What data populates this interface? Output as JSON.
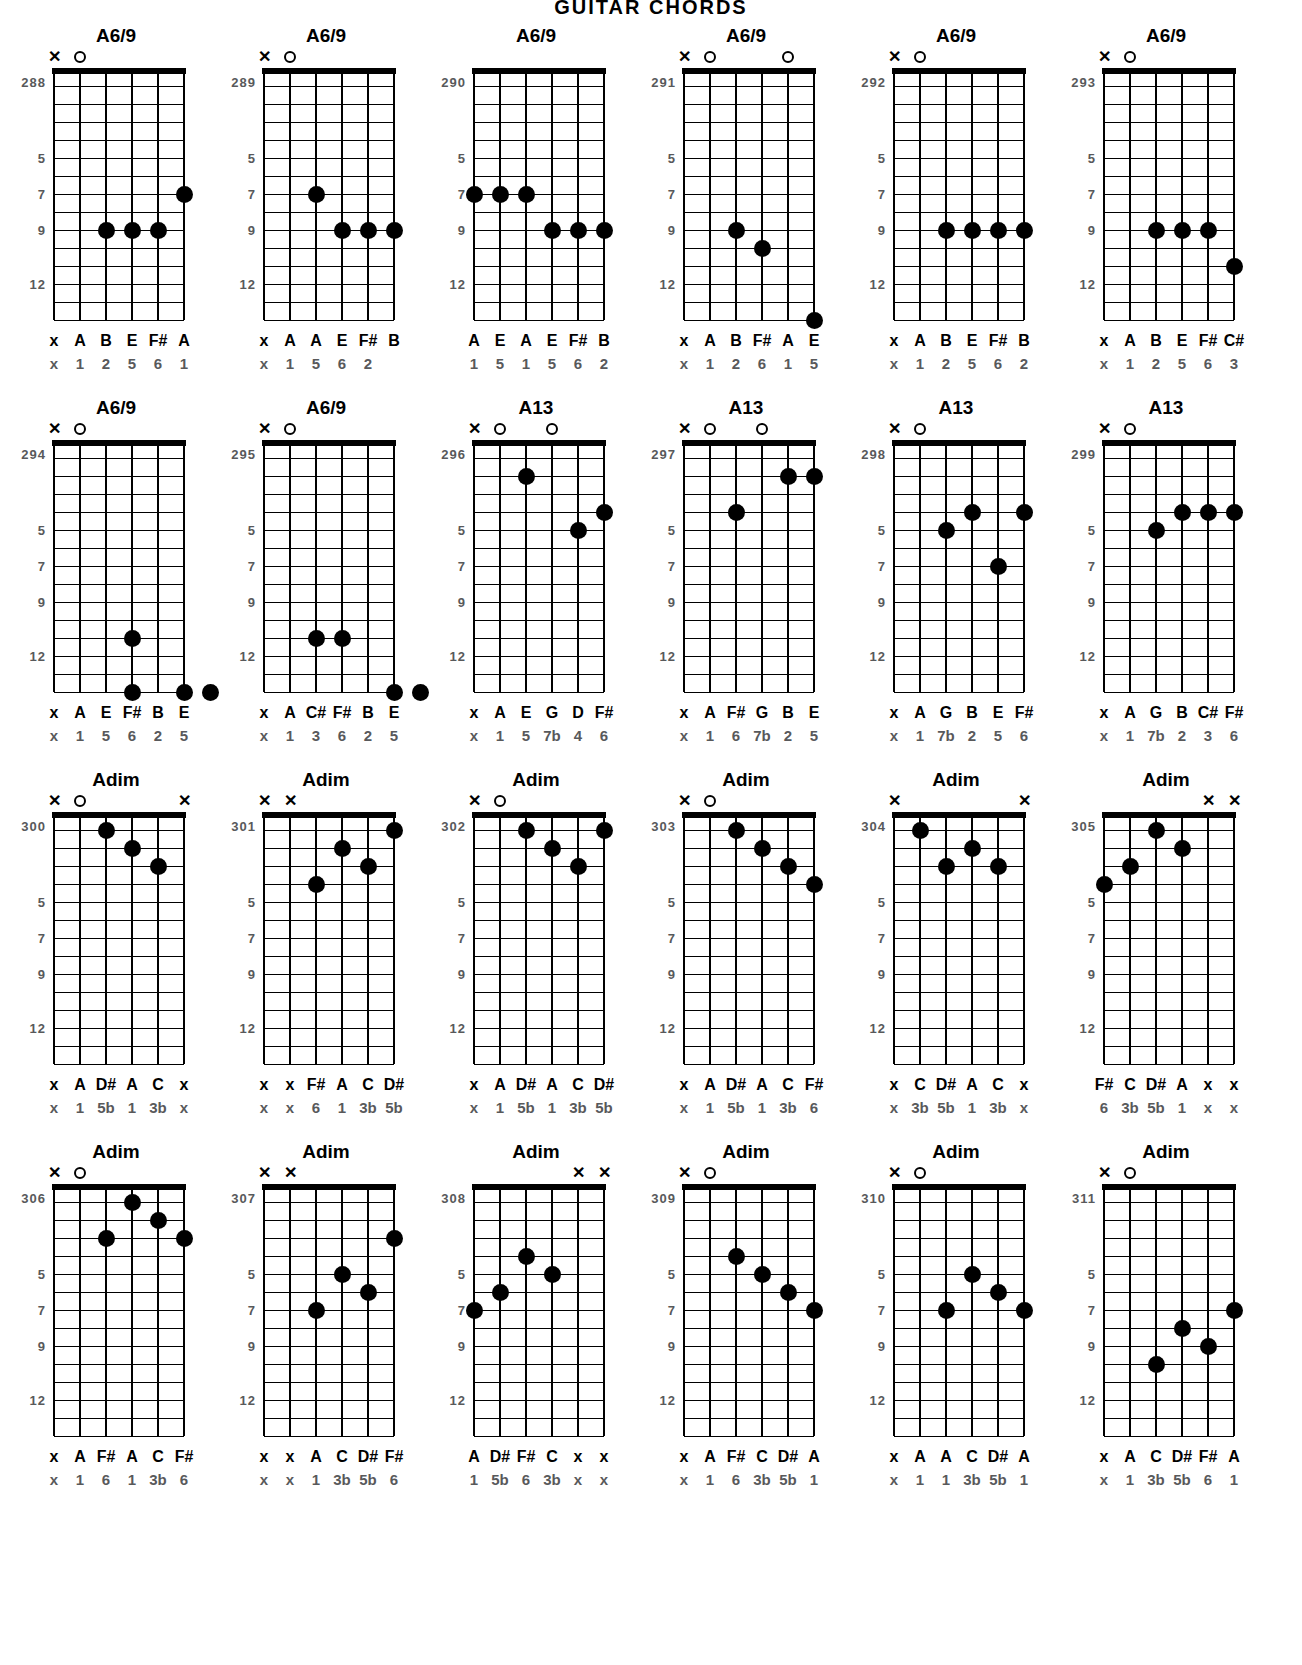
{
  "page": {
    "header": "GUITAR CHORDS",
    "fret_labels": [
      "5",
      "7",
      "9",
      "12"
    ],
    "fret_label_positions": [
      5,
      7,
      9,
      12
    ],
    "total_frets": 14,
    "strings": 6,
    "dot_color": "#000000",
    "number_color": "#58595b"
  },
  "charts": [
    {
      "number": "288",
      "name": "A6/9",
      "markers": [
        "x",
        "o",
        "",
        "",
        "",
        ""
      ],
      "dots": [
        null,
        null,
        9,
        9,
        9,
        7
      ],
      "notes": [
        "x",
        "A",
        "B",
        "E",
        "F#",
        "A"
      ],
      "degrees": [
        "x",
        "1",
        "2",
        "5",
        "6",
        "1"
      ]
    },
    {
      "number": "289",
      "name": "A6/9",
      "markers": [
        "x",
        "o",
        "",
        "",
        "",
        ""
      ],
      "dots": [
        null,
        null,
        7,
        9,
        9,
        9
      ],
      "notes": [
        "x",
        "A",
        "A",
        "E",
        "F#",
        "B"
      ],
      "degrees": [
        "x",
        "1",
        "5",
        "6",
        "2"
      ]
    },
    {
      "number": "290",
      "name": "A6/9",
      "markers": [
        "",
        "",
        "",
        "",
        "",
        ""
      ],
      "dots": [
        7,
        7,
        7,
        9,
        9,
        9
      ],
      "notes": [
        "A",
        "E",
        "A",
        "E",
        "F#",
        "B"
      ],
      "degrees": [
        "1",
        "5",
        "1",
        "5",
        "6",
        "2"
      ]
    },
    {
      "number": "291",
      "name": "A6/9",
      "markers": [
        "x",
        "o",
        "",
        "",
        "o",
        ""
      ],
      "dots": [
        null,
        null,
        9,
        10,
        null,
        14
      ],
      "notes": [
        "x",
        "A",
        "B",
        "F#",
        "A",
        "E"
      ],
      "degrees": [
        "x",
        "1",
        "2",
        "6",
        "1",
        "5"
      ]
    },
    {
      "number": "292",
      "name": "A6/9",
      "markers": [
        "x",
        "o",
        "",
        "",
        "",
        ""
      ],
      "dots": [
        null,
        null,
        9,
        9,
        9,
        9
      ],
      "notes": [
        "x",
        "A",
        "B",
        "E",
        "F#",
        "B"
      ],
      "degrees": [
        "x",
        "1",
        "2",
        "5",
        "6",
        "2"
      ]
    },
    {
      "number": "293",
      "name": "A6/9",
      "markers": [
        "x",
        "o",
        "",
        "",
        "",
        ""
      ],
      "dots": [
        null,
        null,
        9,
        9,
        9,
        11
      ],
      "notes": [
        "x",
        "A",
        "B",
        "E",
        "F#",
        "C#"
      ],
      "degrees": [
        "x",
        "1",
        "2",
        "5",
        "6",
        "3"
      ]
    },
    {
      "number": "294",
      "name": "A6/9",
      "markers": [
        "x",
        "o",
        "",
        "",
        "",
        ""
      ],
      "dots": [
        null,
        null,
        null,
        11,
        null,
        null
      ],
      "extra_dots": [
        {
          "string": 3,
          "fret": 14
        },
        {
          "string": 5,
          "fret": 14
        },
        {
          "string": 6,
          "fret": 14
        }
      ],
      "notes": [
        "x",
        "A",
        "E",
        "F#",
        "B",
        "E"
      ],
      "degrees": [
        "x",
        "1",
        "5",
        "6",
        "2",
        "5"
      ]
    },
    {
      "number": "295",
      "name": "A6/9",
      "markers": [
        "x",
        "o",
        "",
        "",
        "",
        ""
      ],
      "dots": [
        null,
        null,
        11,
        11,
        null,
        null
      ],
      "extra_dots": [
        {
          "string": 5,
          "fret": 14
        },
        {
          "string": 6,
          "fret": 14
        }
      ],
      "notes": [
        "x",
        "A",
        "C#",
        "F#",
        "B",
        "E"
      ],
      "degrees": [
        "x",
        "1",
        "3",
        "6",
        "2",
        "5"
      ]
    },
    {
      "number": "296",
      "name": "A13",
      "markers": [
        "x",
        "o",
        "",
        "o",
        "",
        ""
      ],
      "dots": [
        null,
        null,
        2,
        null,
        5,
        4
      ],
      "notes": [
        "x",
        "A",
        "E",
        "G",
        "D",
        "F#"
      ],
      "degrees": [
        "x",
        "1",
        "5",
        "7b",
        "4",
        "6"
      ]
    },
    {
      "number": "297",
      "name": "A13",
      "markers": [
        "x",
        "o",
        "",
        "o",
        "",
        ""
      ],
      "dots": [
        null,
        null,
        4,
        null,
        2,
        2
      ],
      "notes": [
        "x",
        "A",
        "F#",
        "G",
        "B",
        "E"
      ],
      "degrees": [
        "x",
        "1",
        "6",
        "7b",
        "2",
        "5"
      ]
    },
    {
      "number": "298",
      "name": "A13",
      "markers": [
        "x",
        "o",
        "",
        "",
        "",
        ""
      ],
      "dots": [
        null,
        null,
        5,
        4,
        7,
        4
      ],
      "notes": [
        "x",
        "A",
        "G",
        "B",
        "E",
        "F#"
      ],
      "degrees": [
        "x",
        "1",
        "7b",
        "2",
        "5",
        "6"
      ]
    },
    {
      "number": "299",
      "name": "A13",
      "markers": [
        "x",
        "o",
        "",
        "",
        "",
        ""
      ],
      "dots": [
        null,
        null,
        5,
        4,
        4,
        4
      ],
      "notes": [
        "x",
        "A",
        "G",
        "B",
        "C#",
        "F#"
      ],
      "degrees": [
        "x",
        "1",
        "7b",
        "2",
        "3",
        "6"
      ]
    },
    {
      "number": "300",
      "name": "Adim",
      "markers": [
        "x",
        "o",
        "",
        "",
        "",
        "x"
      ],
      "dots": [
        null,
        null,
        1,
        2,
        3,
        null
      ],
      "notes": [
        "x",
        "A",
        "D#",
        "A",
        "C",
        "x"
      ],
      "degrees": [
        "x",
        "1",
        "5b",
        "1",
        "3b",
        "x"
      ]
    },
    {
      "number": "301",
      "name": "Adim",
      "markers": [
        "x",
        "x",
        "",
        "",
        "",
        ""
      ],
      "dots": [
        null,
        null,
        4,
        2,
        3,
        1
      ],
      "notes": [
        "x",
        "x",
        "F#",
        "A",
        "C",
        "D#"
      ],
      "degrees": [
        "x",
        "x",
        "6",
        "1",
        "3b",
        "5b"
      ]
    },
    {
      "number": "302",
      "name": "Adim",
      "markers": [
        "x",
        "o",
        "",
        "",
        "",
        ""
      ],
      "dots": [
        null,
        null,
        1,
        2,
        3,
        1
      ],
      "notes": [
        "x",
        "A",
        "D#",
        "A",
        "C",
        "D#"
      ],
      "degrees": [
        "x",
        "1",
        "5b",
        "1",
        "3b",
        "5b"
      ]
    },
    {
      "number": "303",
      "name": "Adim",
      "markers": [
        "x",
        "o",
        "",
        "",
        "",
        ""
      ],
      "dots": [
        null,
        null,
        1,
        2,
        3,
        4
      ],
      "notes": [
        "x",
        "A",
        "D#",
        "A",
        "C",
        "F#"
      ],
      "degrees": [
        "x",
        "1",
        "5b",
        "1",
        "3b",
        "6"
      ]
    },
    {
      "number": "304",
      "name": "Adim",
      "markers": [
        "x",
        "",
        "",
        "",
        "",
        "x"
      ],
      "dots": [
        null,
        1,
        3,
        2,
        3,
        null
      ],
      "notes": [
        "x",
        "C",
        "D#",
        "A",
        "C",
        "x"
      ],
      "degrees": [
        "x",
        "3b",
        "5b",
        "1",
        "3b",
        "x"
      ]
    },
    {
      "number": "305",
      "name": "Adim",
      "markers": [
        "",
        "",
        "",
        "",
        "x",
        "x"
      ],
      "dots": [
        4,
        3,
        1,
        2,
        null,
        null
      ],
      "notes": [
        "F#",
        "C",
        "D#",
        "A",
        "x",
        "x"
      ],
      "degrees": [
        "6",
        "3b",
        "5b",
        "1",
        "x",
        "x"
      ]
    },
    {
      "number": "306",
      "name": "Adim",
      "markers": [
        "x",
        "o",
        "",
        "",
        "",
        ""
      ],
      "dots": [
        null,
        null,
        3,
        1,
        2,
        3
      ],
      "notes": [
        "x",
        "A",
        "F#",
        "A",
        "C",
        "F#"
      ],
      "degrees": [
        "x",
        "1",
        "6",
        "1",
        "3b",
        "6"
      ]
    },
    {
      "number": "307",
      "name": "Adim",
      "markers": [
        "x",
        "x",
        "",
        "",
        "",
        ""
      ],
      "dots": [
        null,
        null,
        7,
        5,
        6,
        3
      ],
      "notes": [
        "x",
        "x",
        "A",
        "C",
        "D#",
        "F#"
      ],
      "degrees": [
        "x",
        "x",
        "1",
        "3b",
        "5b",
        "6"
      ]
    },
    {
      "number": "308",
      "name": "Adim",
      "markers": [
        "",
        "",
        "",
        "",
        "x",
        "x"
      ],
      "dots": [
        7,
        6,
        4,
        5,
        null,
        null
      ],
      "notes": [
        "A",
        "D#",
        "F#",
        "C",
        "x",
        "x"
      ],
      "degrees": [
        "1",
        "5b",
        "6",
        "3b",
        "x",
        "x"
      ]
    },
    {
      "number": "309",
      "name": "Adim",
      "markers": [
        "x",
        "o",
        "",
        "",
        "",
        ""
      ],
      "dots": [
        null,
        null,
        4,
        5,
        6,
        7
      ],
      "notes": [
        "x",
        "A",
        "F#",
        "C",
        "D#",
        "A"
      ],
      "degrees": [
        "x",
        "1",
        "6",
        "3b",
        "5b",
        "1"
      ]
    },
    {
      "number": "310",
      "name": "Adim",
      "markers": [
        "x",
        "o",
        "",
        "",
        "",
        ""
      ],
      "dots": [
        null,
        null,
        7,
        5,
        6,
        7
      ],
      "notes": [
        "x",
        "A",
        "A",
        "C",
        "D#",
        "A"
      ],
      "degrees": [
        "x",
        "1",
        "1",
        "3b",
        "5b",
        "1"
      ]
    },
    {
      "number": "311",
      "name": "Adim",
      "markers": [
        "x",
        "o",
        "",
        "",
        "",
        ""
      ],
      "dots": [
        null,
        null,
        10,
        8,
        9,
        7
      ],
      "notes": [
        "x",
        "A",
        "C",
        "D#",
        "F#",
        "A"
      ],
      "degrees": [
        "x",
        "1",
        "3b",
        "5b",
        "6",
        "1"
      ]
    }
  ]
}
